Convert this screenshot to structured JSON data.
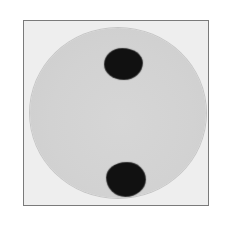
{
  "image": {
    "subject": "petri dish with two dark colonies",
    "colors": {
      "background": "#ffffff",
      "frame_border": "#7a7a7a",
      "frame_fill": "#eeeeee",
      "dish_fill": "#d3d3d3",
      "colony": "#111111"
    },
    "colonies": [
      {
        "position": "top"
      },
      {
        "position": "bottom"
      }
    ]
  }
}
